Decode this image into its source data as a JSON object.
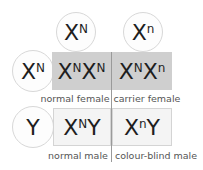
{
  "header_gametes": [
    {
      "base": "X",
      "sup": "N"
    },
    {
      "base": "X",
      "sup": "n"
    }
  ],
  "side_gametes": [
    {
      "base": "X",
      "sup": "N"
    },
    {
      "base": "Y",
      "sup": ""
    }
  ],
  "grid": {
    "female_row": [
      {
        "parts": [
          {
            "base": "X",
            "sup": "N"
          },
          {
            "base": "X",
            "sup": "N"
          }
        ],
        "label": "normal female"
      },
      {
        "parts": [
          {
            "base": "X",
            "sup": "N"
          },
          {
            "base": "X",
            "sup": "n"
          }
        ],
        "label": "carrier female"
      }
    ],
    "male_row": [
      {
        "parts": [
          {
            "base": "X",
            "sup": "N"
          },
          {
            "base": "Y",
            "sup": ""
          }
        ],
        "label": "normal male"
      },
      {
        "parts": [
          {
            "base": "X",
            "sup": "n"
          },
          {
            "base": "Y",
            "sup": ""
          }
        ],
        "label": "colour-blind male"
      }
    ]
  },
  "colors": {
    "female_cell": "#cfcfcf",
    "male_cell": "#f4f4f4",
    "circle_border": "#d8d8d8"
  }
}
